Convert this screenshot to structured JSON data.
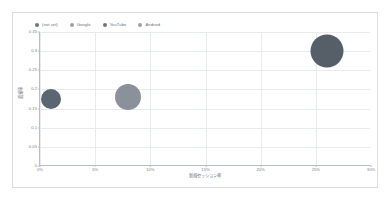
{
  "chart_data": {
    "type": "scatter",
    "title": "",
    "xlabel": "新規セッション率",
    "ylabel": "直帰率",
    "xlim": [
      0,
      30
    ],
    "ylim": [
      0,
      0.35
    ],
    "grid": true,
    "legend_position": "top-left",
    "x_tick_labels": [
      "0%",
      "5%",
      "10%",
      "15%",
      "20%",
      "25%",
      "30%"
    ],
    "x_tick_values": [
      0,
      5,
      10,
      15,
      20,
      25,
      30
    ],
    "y_tick_labels": [
      "0",
      "0.05",
      "0.1",
      "0.15",
      "0.2",
      "0.25",
      "0.3",
      "0.35"
    ],
    "y_tick_values": [
      0,
      0.05,
      0.1,
      0.15,
      0.2,
      0.25,
      0.3,
      0.35
    ],
    "series": [
      {
        "name": "(not set)",
        "color": "#5b6670",
        "x": 1.0,
        "y": 0.175,
        "size": 20
      },
      {
        "name": "Google",
        "color": "#8a9199",
        "x": 8.0,
        "y": 0.18,
        "size": 26
      },
      {
        "name": "YouTube",
        "color": "#565f68",
        "x": 26.0,
        "y": 0.3,
        "size": 33
      },
      {
        "name": "Android",
        "color": "#9aa1a8",
        "x": null,
        "y": null,
        "size": 0
      }
    ]
  },
  "legend": {
    "items": [
      {
        "label": "(not set)",
        "color": "#6e767e"
      },
      {
        "label": "Google",
        "color": "#9aa1a8"
      },
      {
        "label": "YouTube",
        "color": "#6e767e"
      },
      {
        "label": "Android",
        "color": "#9aa1a8"
      }
    ]
  },
  "axes": {
    "x_title": "新規セッション率",
    "y_title": "直帰率"
  }
}
